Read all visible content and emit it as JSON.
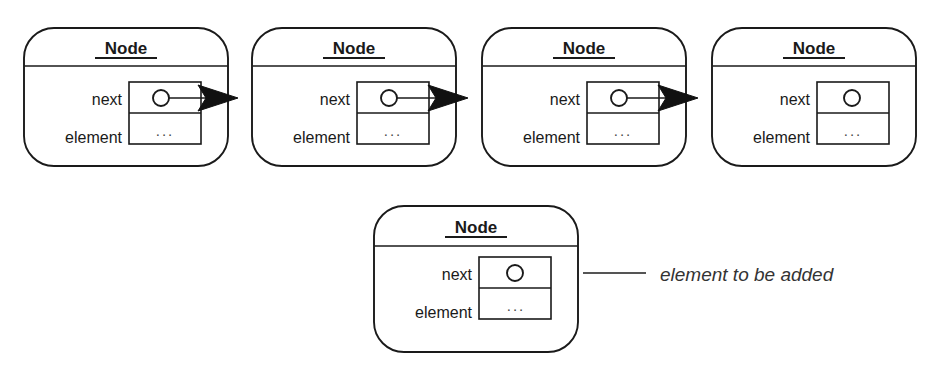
{
  "diagram": {
    "canvas": {
      "width": 933,
      "height": 368,
      "background": "#ffffff"
    },
    "colors": {
      "stroke": "#1a1a1a",
      "arrow_fill": "#111111",
      "leader": "#555555",
      "text": "#1a1a1a",
      "ellipsis_text": "#4a4a4a",
      "background": "#ffffff"
    },
    "labels": {
      "node_title": "Node",
      "field_next": "next",
      "field_element": "element",
      "value_placeholder": "...",
      "annotation": "element to be added"
    },
    "chain_nodes": [
      {
        "id": "node-1",
        "title": "Node",
        "fields": [
          {
            "name": "next",
            "value": "pointer"
          },
          {
            "name": "element",
            "value": "..."
          }
        ],
        "has_outgoing_arrow": true,
        "x": 24,
        "y": 28,
        "width": 204,
        "height": 138
      },
      {
        "id": "node-2",
        "title": "Node",
        "fields": [
          {
            "name": "next",
            "value": "pointer"
          },
          {
            "name": "element",
            "value": "..."
          }
        ],
        "has_outgoing_arrow": true,
        "x": 252,
        "y": 28,
        "width": 204,
        "height": 138
      },
      {
        "id": "node-3",
        "title": "Node",
        "fields": [
          {
            "name": "next",
            "value": "pointer"
          },
          {
            "name": "element",
            "value": "..."
          }
        ],
        "has_outgoing_arrow": true,
        "x": 482,
        "y": 28,
        "width": 204,
        "height": 138
      },
      {
        "id": "node-4",
        "title": "Node",
        "fields": [
          {
            "name": "next",
            "value": "pointer"
          },
          {
            "name": "element",
            "value": "..."
          }
        ],
        "has_outgoing_arrow": false,
        "x": 712,
        "y": 28,
        "width": 204,
        "height": 138
      }
    ],
    "detached_node": {
      "id": "node-new",
      "title": "Node",
      "fields": [
        {
          "name": "next",
          "value": "pointer"
        },
        {
          "name": "element",
          "value": "..."
        }
      ],
      "has_outgoing_arrow": false,
      "x": 374,
      "y": 206,
      "width": 204,
      "height": 146,
      "annotation": "element to be added",
      "leader_line": {
        "x1": 583,
        "y1": 273,
        "x2": 646,
        "y2": 273
      },
      "annotation_position": {
        "x": 660,
        "y": 281
      }
    }
  }
}
